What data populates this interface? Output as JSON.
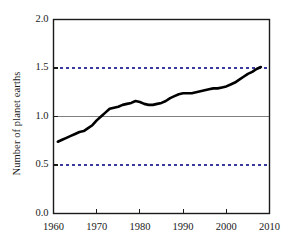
{
  "chart_data": {
    "type": "line",
    "title": "",
    "subtitle": "",
    "xlabel": "",
    "ylabel": "Number of planet earths",
    "xlim": [
      1960,
      2010
    ],
    "ylim": [
      0.0,
      2.0
    ],
    "xticks": [
      1960,
      1970,
      1980,
      1990,
      2000,
      2010
    ],
    "xticklabels": [
      "1960",
      "1970",
      "1980",
      "1990",
      "2000",
      "2010"
    ],
    "yticks": [
      0.0,
      0.5,
      1.0,
      1.5,
      2.0
    ],
    "yticklabels": [
      "0.0",
      "0.5",
      "1.0",
      "1.5",
      "2.0"
    ],
    "grid": "horizontal-dashed-at-0.5-and-1.5",
    "legend": "none",
    "reference_lines": [
      {
        "y": 1.0,
        "style": "solid",
        "color": "#808080",
        "label": ""
      },
      {
        "y": 0.5,
        "style": "dashed",
        "color": "#3a3a9c",
        "label": ""
      },
      {
        "y": 1.5,
        "style": "dashed",
        "color": "#3a3a9c",
        "label": ""
      }
    ],
    "series": [
      {
        "name": "Humanity's Ecological Footprint",
        "color": "#000000",
        "linewidth": 2.6,
        "x": [
          1961,
          1962,
          1963,
          1964,
          1965,
          1966,
          1967,
          1968,
          1969,
          1970,
          1971,
          1972,
          1973,
          1974,
          1975,
          1976,
          1977,
          1978,
          1979,
          1980,
          1981,
          1982,
          1983,
          1984,
          1985,
          1986,
          1987,
          1988,
          1989,
          1990,
          1991,
          1992,
          1993,
          1994,
          1995,
          1996,
          1997,
          1998,
          1999,
          2000,
          2001,
          2002,
          2003,
          2004,
          2005,
          2006,
          2007,
          2008
        ],
        "values": [
          0.74,
          0.76,
          0.78,
          0.8,
          0.82,
          0.84,
          0.85,
          0.88,
          0.91,
          0.96,
          1.0,
          1.04,
          1.08,
          1.09,
          1.1,
          1.12,
          1.13,
          1.14,
          1.16,
          1.15,
          1.13,
          1.12,
          1.12,
          1.13,
          1.14,
          1.16,
          1.19,
          1.21,
          1.23,
          1.24,
          1.24,
          1.24,
          1.25,
          1.26,
          1.27,
          1.28,
          1.29,
          1.29,
          1.3,
          1.31,
          1.33,
          1.35,
          1.38,
          1.41,
          1.44,
          1.46,
          1.49,
          1.51
        ]
      }
    ],
    "axis_color": "#1a1a1a",
    "background": "#ffffff"
  }
}
